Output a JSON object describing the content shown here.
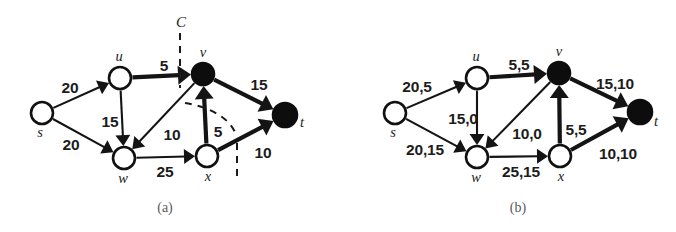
{
  "figure": {
    "background_color": "#ffffff",
    "ink_color": "#141414"
  },
  "panels": [
    {
      "id": "panel-a",
      "caption": "(a)",
      "cut_label": "C",
      "nodes": [
        {
          "id": "s",
          "label": "s",
          "x": 42,
          "y": 113,
          "r": 11,
          "style": "open",
          "label_dx": -2,
          "label_dy": 24
        },
        {
          "id": "u",
          "label": "u",
          "x": 120,
          "y": 78,
          "r": 11,
          "style": "open",
          "label_dx": -1,
          "label_dy": -17
        },
        {
          "id": "w",
          "label": "w",
          "x": 124,
          "y": 158,
          "r": 11,
          "style": "open",
          "label_dx": -1,
          "label_dy": 25
        },
        {
          "id": "v",
          "label": "v",
          "x": 203,
          "y": 74,
          "r": 11,
          "style": "filled",
          "label_dx": 0,
          "label_dy": -17
        },
        {
          "id": "x",
          "label": "x",
          "x": 207,
          "y": 156,
          "r": 11,
          "style": "open",
          "label_dx": 1,
          "label_dy": 25
        },
        {
          "id": "t",
          "label": "t",
          "x": 285,
          "y": 115,
          "r": 12,
          "style": "filled",
          "label_dx": 17,
          "label_dy": 12
        }
      ],
      "edges": [
        {
          "from": "s",
          "to": "u",
          "label": "20",
          "weight": "thin",
          "label_x": 70,
          "label_y": 93
        },
        {
          "from": "s",
          "to": "w",
          "label": "20",
          "weight": "thin",
          "label_x": 71,
          "label_y": 150
        },
        {
          "from": "u",
          "to": "w",
          "label": "15",
          "weight": "thin",
          "label_x": 110,
          "label_y": 127
        },
        {
          "from": "u",
          "to": "v",
          "label": "5",
          "weight": "thick",
          "label_x": 164,
          "label_y": 71
        },
        {
          "from": "v",
          "to": "w",
          "label": "10",
          "weight": "thin",
          "label_x": 172,
          "label_y": 140
        },
        {
          "from": "w",
          "to": "x",
          "label": "25",
          "weight": "thin",
          "label_x": 165,
          "label_y": 177
        },
        {
          "from": "x",
          "to": "v",
          "label": "5",
          "weight": "thick",
          "label_x": 218,
          "label_y": 137
        },
        {
          "from": "v",
          "to": "t",
          "label": "15",
          "weight": "thick",
          "label_x": 259,
          "label_y": 90
        },
        {
          "from": "x",
          "to": "t",
          "label": "10",
          "weight": "thick",
          "label_x": 263,
          "label_y": 158
        }
      ]
    },
    {
      "id": "panel-b",
      "caption": "(b)",
      "cut_label": null,
      "nodes": [
        {
          "id": "s",
          "label": "s",
          "x": 395,
          "y": 113,
          "r": 11,
          "style": "open",
          "label_dx": -2,
          "label_dy": 24
        },
        {
          "id": "u",
          "label": "u",
          "x": 477,
          "y": 78,
          "r": 11,
          "style": "open",
          "label_dx": -1,
          "label_dy": -17
        },
        {
          "id": "w",
          "label": "w",
          "x": 477,
          "y": 157,
          "r": 11,
          "style": "open",
          "label_dx": -1,
          "label_dy": 25
        },
        {
          "id": "v",
          "label": "v",
          "x": 559,
          "y": 73,
          "r": 11,
          "style": "filled",
          "label_dx": 0,
          "label_dy": -17
        },
        {
          "id": "x",
          "label": "x",
          "x": 560,
          "y": 156,
          "r": 11,
          "style": "open",
          "label_dx": 1,
          "label_dy": 25
        },
        {
          "id": "t",
          "label": "t",
          "x": 640,
          "y": 112,
          "r": 12,
          "style": "filled",
          "label_dx": 16,
          "label_dy": 14
        }
      ],
      "edges": [
        {
          "from": "s",
          "to": "u",
          "label": "20,5",
          "weight": "thin",
          "label_x": 417,
          "label_y": 92
        },
        {
          "from": "s",
          "to": "w",
          "label": "20,15",
          "weight": "thin",
          "label_x": 425,
          "label_y": 155
        },
        {
          "from": "u",
          "to": "w",
          "label": "15,0",
          "weight": "thin",
          "label_x": 463,
          "label_y": 124
        },
        {
          "from": "u",
          "to": "v",
          "label": "5,5",
          "weight": "thick",
          "label_x": 519,
          "label_y": 70
        },
        {
          "from": "v",
          "to": "w",
          "label": "10,0",
          "weight": "thin",
          "label_x": 527,
          "label_y": 139
        },
        {
          "from": "w",
          "to": "x",
          "label": "25,15",
          "weight": "thin",
          "label_x": 521,
          "label_y": 177
        },
        {
          "from": "x",
          "to": "v",
          "label": "5,5",
          "weight": "thick",
          "label_x": 576,
          "label_y": 135
        },
        {
          "from": "v",
          "to": "t",
          "label": "15,10",
          "weight": "thick",
          "label_x": 615,
          "label_y": 89
        },
        {
          "from": "x",
          "to": "t",
          "label": "10,10",
          "weight": "thick",
          "label_x": 618,
          "label_y": 159
        }
      ]
    }
  ],
  "chart_data": {
    "type": "diagram",
    "diagram_kind": "flow-network",
    "panel_a": {
      "caption": "(a)",
      "description": "Flow network with capacities and a dashed cut C",
      "vertices": [
        "s",
        "u",
        "w",
        "v",
        "x",
        "t"
      ],
      "saturated_vertices": [
        "v",
        "t"
      ],
      "edges": [
        {
          "from": "s",
          "to": "u",
          "capacity": 20,
          "highlighted": false
        },
        {
          "from": "s",
          "to": "w",
          "capacity": 20,
          "highlighted": false
        },
        {
          "from": "u",
          "to": "w",
          "capacity": 15,
          "highlighted": false
        },
        {
          "from": "u",
          "to": "v",
          "capacity": 5,
          "highlighted": true
        },
        {
          "from": "v",
          "to": "w",
          "capacity": 10,
          "highlighted": false
        },
        {
          "from": "w",
          "to": "x",
          "capacity": 25,
          "highlighted": false
        },
        {
          "from": "x",
          "to": "v",
          "capacity": 5,
          "highlighted": true
        },
        {
          "from": "v",
          "to": "t",
          "capacity": 15,
          "highlighted": true
        },
        {
          "from": "x",
          "to": "t",
          "capacity": 10,
          "highlighted": true
        }
      ],
      "cut": {
        "name": "C",
        "crosses": [
          "u->v",
          "x->t"
        ]
      }
    },
    "panel_b": {
      "caption": "(b)",
      "description": "Same network labelled capacity,flow",
      "vertices": [
        "s",
        "u",
        "w",
        "v",
        "x",
        "t"
      ],
      "saturated_vertices": [
        "v",
        "t"
      ],
      "edges": [
        {
          "from": "s",
          "to": "u",
          "capacity": 20,
          "flow": 5,
          "highlighted": false
        },
        {
          "from": "s",
          "to": "w",
          "capacity": 20,
          "flow": 15,
          "highlighted": false
        },
        {
          "from": "u",
          "to": "w",
          "capacity": 15,
          "flow": 0,
          "highlighted": false
        },
        {
          "from": "u",
          "to": "v",
          "capacity": 5,
          "flow": 5,
          "highlighted": true
        },
        {
          "from": "v",
          "to": "w",
          "capacity": 10,
          "flow": 0,
          "highlighted": false
        },
        {
          "from": "w",
          "to": "x",
          "capacity": 25,
          "flow": 15,
          "highlighted": false
        },
        {
          "from": "x",
          "to": "v",
          "capacity": 5,
          "flow": 5,
          "highlighted": true
        },
        {
          "from": "v",
          "to": "t",
          "capacity": 15,
          "flow": 10,
          "highlighted": true
        },
        {
          "from": "x",
          "to": "t",
          "capacity": 10,
          "flow": 10,
          "highlighted": true
        }
      ]
    }
  }
}
